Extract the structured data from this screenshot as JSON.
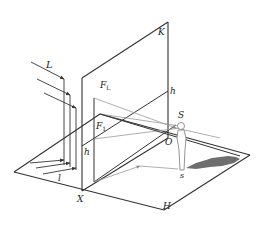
{
  "diagram": {
    "colors": {
      "line_dark": "#333333",
      "line_light": "#9a9a9a",
      "shadow": "#6e6e6e",
      "background": "#ffffff"
    },
    "labels": {
      "K": "K",
      "h_upper": "h",
      "h_lower": "h",
      "F_L": "F",
      "F_L_sub": "L",
      "F_1": "F",
      "F_1_sub": "1",
      "L": "L",
      "l": "l",
      "S": "S",
      "O": "O",
      "s": "s",
      "X": "X",
      "H": "H"
    }
  }
}
